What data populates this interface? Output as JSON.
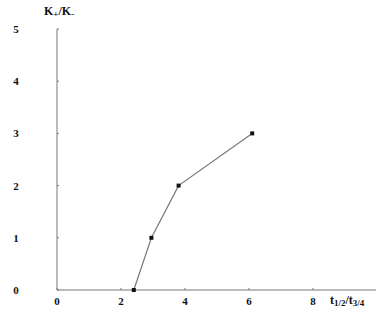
{
  "chart_data": {
    "type": "line",
    "title": "",
    "xlabel": "t1/2/t3/4",
    "xlabel_parts": {
      "t1": "t",
      "s1": "1/2",
      "slash": "/",
      "t2": "t",
      "s2": "3/4"
    },
    "ylabel": "K+/K-",
    "ylabel_parts": {
      "k1": "K",
      "p1": "+",
      "slash": "/",
      "k2": "K",
      "p2": "-"
    },
    "xlim": [
      0,
      10
    ],
    "ylim": [
      0,
      5
    ],
    "x_ticks": [
      "0",
      "2",
      "4",
      "6",
      "8"
    ],
    "y_ticks": [
      "0",
      "1",
      "2",
      "3",
      "4",
      "5"
    ],
    "grid": false,
    "legend": null,
    "series": [
      {
        "name": "K+/K- vs t1/2/t3/4",
        "marker": "square",
        "color": "#555555",
        "x": [
          2.4,
          2.95,
          3.8,
          6.1
        ],
        "y": [
          0,
          1,
          2,
          3
        ]
      }
    ]
  }
}
